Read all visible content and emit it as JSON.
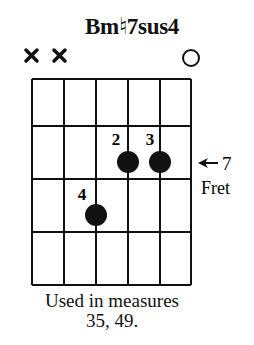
{
  "chord": {
    "name": "Bm♮7sus4",
    "strings": 6,
    "frets_shown": 4,
    "string_markers": [
      "x",
      "x",
      "",
      "",
      "",
      "o"
    ],
    "position": {
      "fret": 7,
      "label_number": "7",
      "label_text": "Fret",
      "arrow": "←"
    },
    "fingers": [
      {
        "finger": "2",
        "string": 4,
        "fret_row": 1
      },
      {
        "finger": "3",
        "string": 5,
        "fret_row": 1
      },
      {
        "finger": "4",
        "string": 3,
        "fret_row": 2
      }
    ]
  },
  "caption": {
    "line1": "Used in measures",
    "line2": "35, 49."
  }
}
